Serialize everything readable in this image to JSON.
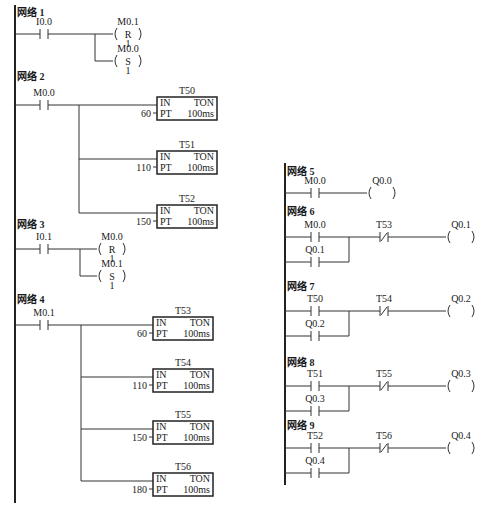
{
  "diagram": {
    "network_prefix": "网络",
    "timer_type": "TON",
    "timer_base": "100ms",
    "pins": {
      "in": "IN",
      "pt": "PT"
    },
    "left_column": [
      {
        "network": "网络 1",
        "contact": {
          "address": "I0.0",
          "type": "NO"
        },
        "outputs": [
          {
            "address": "M0.1",
            "kind": "coil",
            "op": "R",
            "count": "1"
          },
          {
            "address": "M0.0",
            "kind": "coil",
            "op": "S",
            "count": "1"
          }
        ]
      },
      {
        "network": "网络 2",
        "contact": {
          "address": "M0.0",
          "type": "NO"
        },
        "outputs": [
          {
            "address": "T50",
            "kind": "timer",
            "pt": "60"
          },
          {
            "address": "T51",
            "kind": "timer",
            "pt": "110"
          },
          {
            "address": "T52",
            "kind": "timer",
            "pt": "150"
          }
        ]
      },
      {
        "network": "网络 3",
        "contact": {
          "address": "I0.1",
          "type": "NO"
        },
        "outputs": [
          {
            "address": "M0.0",
            "kind": "coil",
            "op": "R",
            "count": "1"
          },
          {
            "address": "M0.1",
            "kind": "coil",
            "op": "S",
            "count": "1"
          }
        ]
      },
      {
        "network": "网络 4",
        "contact": {
          "address": "M0.1",
          "type": "NO"
        },
        "outputs": [
          {
            "address": "T53",
            "kind": "timer",
            "pt": "60"
          },
          {
            "address": "T54",
            "kind": "timer",
            "pt": "110"
          },
          {
            "address": "T55",
            "kind": "timer",
            "pt": "150"
          },
          {
            "address": "T56",
            "kind": "timer",
            "pt": "180"
          }
        ]
      }
    ],
    "right_column": [
      {
        "network": "网络 5",
        "contact": {
          "address": "M0.0",
          "type": "NO"
        },
        "output": {
          "address": "Q0.0"
        }
      },
      {
        "network": "网络 6",
        "contact": {
          "address": "M0.0",
          "type": "NO"
        },
        "hold": {
          "address": "Q0.1",
          "type": "NO"
        },
        "interlock": {
          "address": "T53",
          "type": "NC"
        },
        "output": {
          "address": "Q0.1"
        }
      },
      {
        "network": "网络 7",
        "contact": {
          "address": "T50",
          "type": "NO"
        },
        "hold": {
          "address": "Q0.2",
          "type": "NO"
        },
        "interlock": {
          "address": "T54",
          "type": "NC"
        },
        "output": {
          "address": "Q0.2"
        }
      },
      {
        "network": "网络 8",
        "contact": {
          "address": "T51",
          "type": "NO"
        },
        "hold": {
          "address": "Q0.3",
          "type": "NO"
        },
        "interlock": {
          "address": "T55",
          "type": "NC"
        },
        "output": {
          "address": "Q0.3"
        }
      },
      {
        "network": "网络 9",
        "contact": {
          "address": "T52",
          "type": "NO"
        },
        "hold": {
          "address": "Q0.4",
          "type": "NO"
        },
        "interlock": {
          "address": "T56",
          "type": "NC"
        },
        "output": {
          "address": "Q0.4"
        }
      }
    ]
  }
}
